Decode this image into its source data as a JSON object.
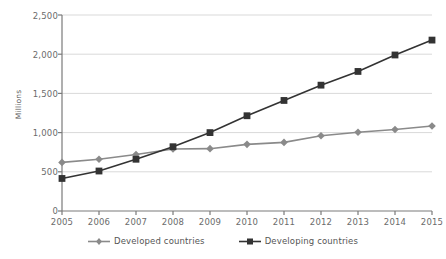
{
  "chart_data": {
    "type": "line",
    "title": "",
    "subtitle": "",
    "xlabel": "",
    "ylabel": "Millions",
    "categories": [
      "2005",
      "2006",
      "2007",
      "2008",
      "2009",
      "2010",
      "2011",
      "2012",
      "2013",
      "2014",
      "2015"
    ],
    "x": [
      2005,
      2006,
      2007,
      2008,
      2009,
      2010,
      2011,
      2012,
      2013,
      2014,
      2015
    ],
    "ylim": [
      0,
      2500
    ],
    "ytick_values": [
      0,
      500,
      1000,
      1500,
      2000,
      2500
    ],
    "ytick_labels": [
      "0",
      "500",
      "1,000",
      "1,500",
      "2,000",
      "2,500"
    ],
    "grid": "horizontal",
    "legend_position": "bottom",
    "series": [
      {
        "name": "Developed countries",
        "marker": "diamond",
        "color": "#8a8a8a",
        "values": [
          620,
          660,
          720,
          790,
          795,
          850,
          875,
          960,
          1005,
          1040,
          1085
        ]
      },
      {
        "name": "Developing countries",
        "marker": "square",
        "color": "#333333",
        "values": [
          415,
          510,
          660,
          820,
          1000,
          1215,
          1410,
          1605,
          1780,
          1990,
          2180
        ]
      }
    ],
    "annotations": []
  },
  "colors": {
    "developed": "#8a8a8a",
    "developing": "#333333",
    "gridline": "#d9d9d9",
    "axis": "#7a7a7a",
    "tick_text": "#6b6b6b"
  },
  "legend": {
    "items": [
      {
        "label": "Developed countries",
        "key": "diamond-marker-icon"
      },
      {
        "label": "Developing countries",
        "key": "square-marker-icon"
      }
    ]
  }
}
